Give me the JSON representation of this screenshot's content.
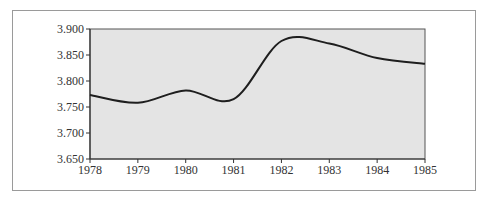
{
  "chart_data": {
    "type": "line",
    "title": "",
    "xlabel": "",
    "ylabel": "",
    "x": [
      1978,
      1979,
      1980,
      1981,
      1982,
      1983,
      1984,
      1985
    ],
    "series": [
      {
        "name": "",
        "values": [
          3.773,
          3.758,
          3.782,
          3.765,
          3.877,
          3.872,
          3.844,
          3.833
        ]
      }
    ],
    "x_tick_labels": [
      "1978",
      "1979",
      "1980",
      "1981",
      "1982",
      "1983",
      "1984",
      "1985"
    ],
    "y_tick_labels": [
      "3.650",
      "3.700",
      "3.750",
      "3.800",
      "3.850",
      "3.900"
    ],
    "ylim": [
      3.65,
      3.9
    ],
    "xlim": [
      1978,
      1985
    ],
    "grid": false,
    "legend": "none",
    "smooth": true,
    "colors": {
      "plot_background": "#e4e4e4",
      "line": "#1e1e1e",
      "axis": "#333333",
      "frame_border": "#9a9a9a"
    }
  }
}
